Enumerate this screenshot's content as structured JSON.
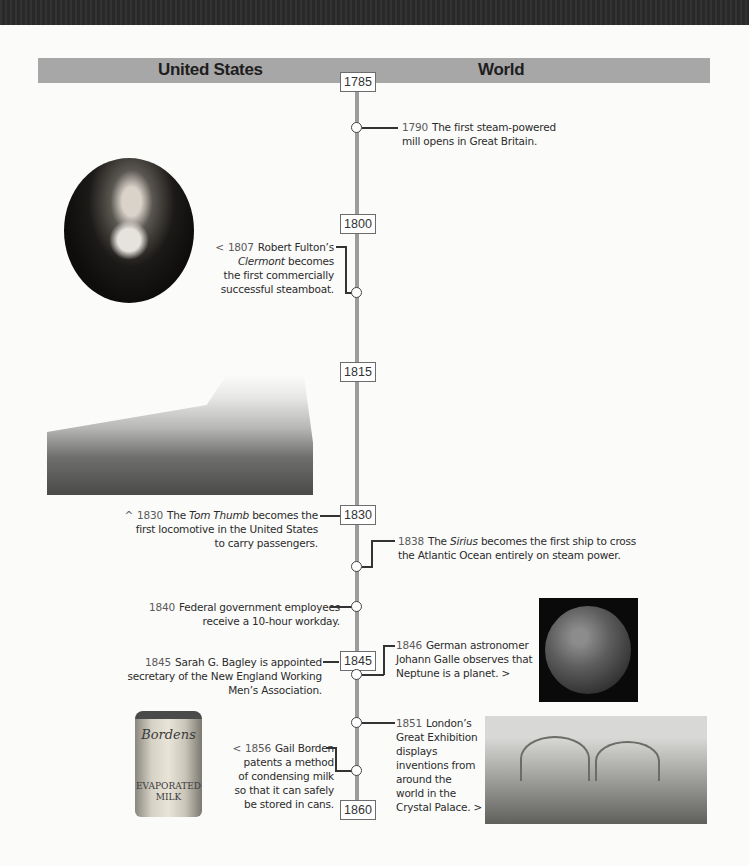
{
  "header": {
    "left_label": "United States",
    "right_label": "World"
  },
  "axis": {
    "years": [
      "1785",
      "1800",
      "1815",
      "1830",
      "1845",
      "1860"
    ]
  },
  "events": {
    "e1790": {
      "year": "1790",
      "text_a": "The first steam-powered",
      "text_b": "mill opens in Great Britain.",
      "side": "World"
    },
    "e1807": {
      "prefix": "<",
      "year": "1807",
      "line1": "Robert Fulton’s",
      "italic": "Clermont",
      "line2_rest": " becomes",
      "line3": "the first commercially",
      "line4": "successful steamboat.",
      "side": "United States"
    },
    "e1830": {
      "prefix": "^",
      "year": "1830",
      "pre": "The ",
      "italic": "Tom Thumb",
      "post": " becomes the",
      "line2": "first locomotive in the United States",
      "line3": "to carry passengers.",
      "side": "United States"
    },
    "e1838": {
      "year": "1838",
      "pre": "The ",
      "italic": "Sirius",
      "post": " becomes the first ship to cross",
      "line2": "the Atlantic Ocean entirely on steam power.",
      "side": "World"
    },
    "e1840": {
      "year": "1840",
      "line1": "Federal government employees",
      "line2": "receive a 10-hour workday.",
      "side": "United States"
    },
    "e1845": {
      "year": "1845",
      "line1": "Sarah G. Bagley is appointed",
      "line2": "secretary of the New England Working",
      "line3": "Men’s Association.",
      "side": "United States"
    },
    "e1846": {
      "year": "1846",
      "line1": "German astronomer",
      "line2": "Johann Galle observes that",
      "line3": "Neptune is a planet. >",
      "side": "World"
    },
    "e1851": {
      "year": "1851",
      "line1": "London’s",
      "line2": "Great Exhibition",
      "line3": "displays",
      "line4": "inventions from",
      "line5": "around the",
      "line6": "world in the",
      "line7": "Crystal Palace. >",
      "side": "World"
    },
    "e1856": {
      "prefix": "<",
      "year": "1856",
      "line1": "Gail Borden",
      "line2": "patents a method",
      "line3": "of condensing milk",
      "line4": "so that it can safely",
      "line5": "be stored in cans.",
      "side": "United States"
    }
  },
  "images": {
    "portrait": "Robert Fulton portrait",
    "train": "Steam locomotive train",
    "neptune": "Planet Neptune",
    "can": {
      "brand": "Bordens",
      "label1": "EVAPORATED",
      "label2": "MILK"
    },
    "palace": "Crystal Palace engraving"
  },
  "colors": {
    "header_bg": "#a7a7a7",
    "axis": "#9c9c9c",
    "top_band": "#2b2b2b"
  }
}
